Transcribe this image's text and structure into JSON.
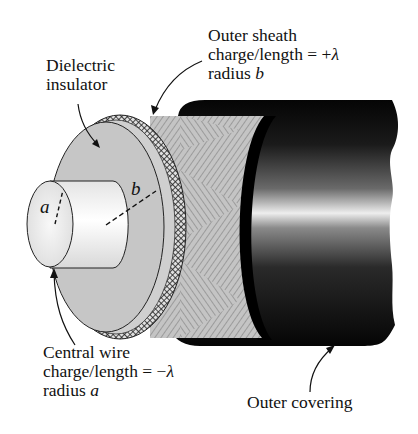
{
  "figure": {
    "labels": {
      "dielectric": {
        "line1": "Dielectric",
        "line2": "insulator"
      },
      "outer_sheath": {
        "line1": "Outer sheath",
        "line2_prefix": "charge/length = +",
        "line2_symbol": "λ",
        "line3_prefix": "radius ",
        "line3_symbol": "b"
      },
      "central_wire": {
        "line1": "Central wire",
        "line2_prefix": "charge/length = −",
        "line2_symbol": "λ",
        "line3_prefix": "radius ",
        "line3_symbol": "a"
      },
      "outer_covering": {
        "line1": "Outer covering"
      },
      "radius_a": "a",
      "radius_b": "b"
    },
    "colors": {
      "background": "#ffffff",
      "wire": "#f2f2f2",
      "dielectric": "#c8c8c8",
      "braid": "#3a3a3a",
      "shield_hatch": "#b8b8b8",
      "covering_dark": "#0a0a0a",
      "covering_highlight": "#e8e8e8",
      "text": "#111111"
    }
  }
}
